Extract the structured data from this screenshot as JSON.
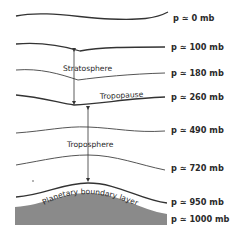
{
  "diagram": {
    "type": "atmosphere-layers-schematic",
    "pressure_levels": [
      {
        "symbol": "p",
        "approx": "≃",
        "value": "0 mb",
        "label": "p ≃ 0 mb"
      },
      {
        "symbol": "p",
        "approx": "≃",
        "value": "100 mb",
        "label": "p ≃ 100 mb"
      },
      {
        "symbol": "p",
        "approx": "≃",
        "value": "180 mb",
        "label": "p ≃ 180 mb"
      },
      {
        "symbol": "p",
        "approx": "≃",
        "value": "260 mb",
        "label": "p ≃ 260 mb"
      },
      {
        "symbol": "p",
        "approx": "≃",
        "value": "490 mb",
        "label": "p ≃ 490 mb"
      },
      {
        "symbol": "p",
        "approx": "≃",
        "value": "720 mb",
        "label": "p ≃ 720 mb"
      },
      {
        "symbol": "p",
        "approx": "≃",
        "value": "950 mb",
        "label": "p ≃ 950 mb"
      },
      {
        "symbol": "p",
        "approx": "≃",
        "value": "1000 mb",
        "label": "p ≃ 1000 mb"
      }
    ],
    "layers": {
      "stratosphere": "Stratosphere",
      "tropopause": "Tropopause",
      "troposphere": "Troposphere",
      "boundary_layer": "Planetary boundary layer"
    },
    "colors": {
      "lines": "#333333",
      "ground": "#8a8a8a",
      "background": "#ffffff",
      "text": "#2a2a2a"
    }
  }
}
